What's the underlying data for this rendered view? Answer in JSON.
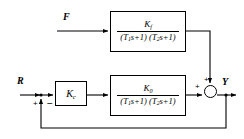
{
  "diagram": {
    "type": "control-block-diagram",
    "background_color": "#ffffff",
    "line_color": "#000000",
    "shadow_color": "#b9b9b9"
  },
  "signals": {
    "feedforward_input": "F",
    "reference_input": "R",
    "output": "Y"
  },
  "summing_junctions": {
    "left": {
      "name": "error-junction",
      "plus_sign": "+",
      "minus_sign": "−"
    },
    "right": {
      "name": "output-junction",
      "plus_sign_left": "+",
      "plus_sign_top": "+"
    }
  },
  "blocks": {
    "feedforward": {
      "name": "feedforward-block",
      "numerator": "K",
      "numerator_sub": "f",
      "denominator_open": "(",
      "denominator": "T",
      "den_sub_1": "1",
      "den_mid": "s+1) (",
      "den_sub_2": "2",
      "den_close": "s+1)",
      "denominator_text": "(T1s+1) (T2s+1)"
    },
    "process": {
      "name": "process-block",
      "numerator": "K",
      "numerator_sub": "0",
      "denominator_text": "(T1s+1) (T2s+1)"
    },
    "controller": {
      "name": "controller-block",
      "gain": "K",
      "gain_sub": "c"
    }
  }
}
